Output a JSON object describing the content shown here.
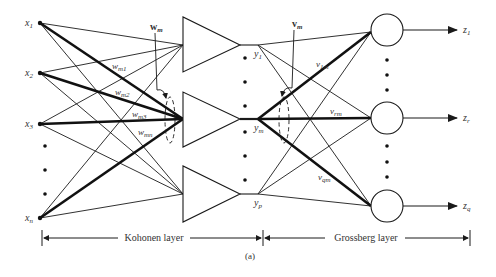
{
  "figure": {
    "caption": "(a)",
    "inputs": [
      {
        "label": "x",
        "sub": "1",
        "y": 23
      },
      {
        "label": "x",
        "sub": "2",
        "y": 73
      },
      {
        "label": "x",
        "sub": "3",
        "y": 124
      },
      {
        "label": "x",
        "sub": "n",
        "y": 218
      }
    ],
    "input_ellipsis_dots_y": [
      146,
      170,
      194
    ],
    "kohonen_units": [
      {
        "out_label": "y",
        "out_sub": "1",
        "y": 45
      },
      {
        "out_label": "y",
        "out_sub": "m",
        "y": 119
      },
      {
        "out_label": "y",
        "out_sub": "p",
        "y": 194
      }
    ],
    "kohonen_weight_labels": [
      {
        "label": "w",
        "sub": "m1"
      },
      {
        "label": "w",
        "sub": "m2"
      },
      {
        "label": "w",
        "sub": "m3"
      },
      {
        "label": "w",
        "sub": "mn"
      }
    ],
    "kohonen_weight_vector": {
      "label": "w",
      "sub": "m"
    },
    "grossberg_weight_vector": {
      "label": "v",
      "sub": "m"
    },
    "grossberg_weight_labels": [
      {
        "label": "v",
        "sub": "1m"
      },
      {
        "label": "v",
        "sub": "rm"
      },
      {
        "label": "v",
        "sub": "qm"
      }
    ],
    "grossberg_units": [
      {
        "out_label": "z",
        "out_sub": "1",
        "y": 30
      },
      {
        "out_label": "z",
        "out_sub": "r",
        "y": 118
      },
      {
        "out_label": "z",
        "out_sub": "q",
        "y": 206
      }
    ],
    "layers": {
      "kohonen": "Kohonen layer",
      "grossberg": "Grossberg layer"
    },
    "colors": {
      "stroke": "#1a1a1a",
      "text": "#333333",
      "background": "#ffffff"
    }
  }
}
